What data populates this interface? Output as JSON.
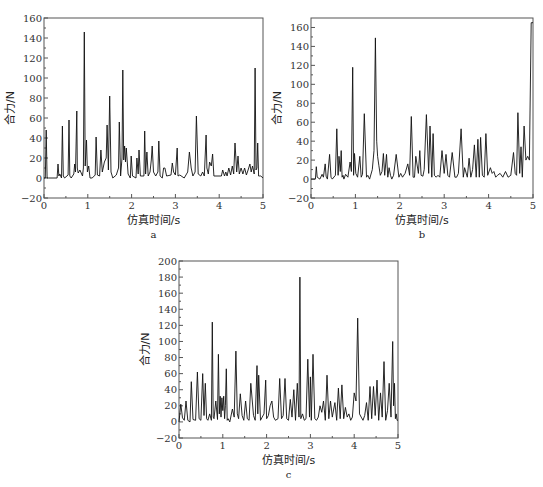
{
  "chart_data": [
    {
      "type": "line",
      "panel_label": "a",
      "title": "",
      "xlabel": "仿真时间/s",
      "ylabel": "合力/N",
      "xlim": [
        0,
        5
      ],
      "ylim": [
        -20,
        160
      ],
      "xticks": [
        0,
        1,
        2,
        3,
        4,
        5
      ],
      "yticks": [
        -20,
        0,
        20,
        40,
        60,
        80,
        100,
        120,
        140,
        160
      ],
      "grid": false,
      "legend": null,
      "series": [
        {
          "name": "合力",
          "x": [
            0,
            0.03,
            0.05,
            0.07,
            0.1,
            0.3,
            0.32,
            0.34,
            0.36,
            0.4,
            0.42,
            0.44,
            0.47,
            0.55,
            0.57,
            0.59,
            0.62,
            0.68,
            0.7,
            0.72,
            0.75,
            0.76,
            0.78,
            0.82,
            0.88,
            0.9,
            0.92,
            0.94,
            0.97,
            0.99,
            1.02,
            1.05,
            1.1,
            1.17,
            1.19,
            1.22,
            1.27,
            1.3,
            1.33,
            1.38,
            1.42,
            1.44,
            1.47,
            1.5,
            1.53,
            1.57,
            1.65,
            1.7,
            1.72,
            1.75,
            1.78,
            1.8,
            1.82,
            1.84,
            1.86,
            1.88,
            1.92,
            1.97,
            1.99,
            2.02,
            2.1,
            2.12,
            2.15,
            2.17,
            2.2,
            2.28,
            2.3,
            2.32,
            2.35,
            2.38,
            2.42,
            2.45,
            2.47,
            2.5,
            2.55,
            2.6,
            2.62,
            2.65,
            2.7,
            2.73,
            2.76,
            2.8,
            2.9,
            2.93,
            2.96,
            3.0,
            3.04,
            3.06,
            3.1,
            3.2,
            3.28,
            3.32,
            3.36,
            3.4,
            3.45,
            3.48,
            3.52,
            3.58,
            3.62,
            3.66,
            3.7,
            3.72,
            3.75,
            3.78,
            3.82,
            3.85,
            3.88,
            3.95,
            4.05,
            4.08,
            4.12,
            4.15,
            4.18,
            4.22,
            4.26,
            4.3,
            4.33,
            4.36,
            4.4,
            4.43,
            4.46,
            4.5,
            4.54,
            4.58,
            4.62,
            4.66,
            4.7,
            4.73,
            4.76,
            4.8,
            4.82,
            4.84,
            4.86,
            4.88,
            4.9,
            4.92,
            4.95,
            5.0
          ],
          "values": [
            0,
            0,
            48,
            0,
            0,
            0,
            14,
            2,
            4,
            0,
            52,
            2,
            0,
            3,
            58,
            2,
            0,
            4,
            14,
            6,
            67,
            10,
            5,
            8,
            2,
            10,
            146,
            12,
            38,
            6,
            12,
            0,
            0,
            3,
            41,
            3,
            2,
            28,
            6,
            16,
            20,
            53,
            8,
            82,
            6,
            0,
            3,
            10,
            56,
            2,
            20,
            108,
            18,
            32,
            16,
            30,
            4,
            0,
            22,
            2,
            0,
            20,
            4,
            28,
            2,
            2,
            47,
            4,
            26,
            2,
            6,
            18,
            32,
            6,
            2,
            6,
            37,
            2,
            0,
            10,
            10,
            2,
            3,
            15,
            6,
            3,
            30,
            2,
            3,
            0,
            6,
            26,
            10,
            2,
            6,
            62,
            4,
            2,
            6,
            2,
            43,
            10,
            4,
            16,
            12,
            24,
            2,
            2,
            2,
            8,
            2,
            6,
            2,
            10,
            3,
            12,
            4,
            35,
            6,
            22,
            4,
            10,
            4,
            10,
            3,
            8,
            14,
            6,
            12,
            4,
            110,
            8,
            10,
            35,
            2,
            2,
            2,
            0
          ]
        }
      ]
    },
    {
      "type": "line",
      "panel_label": "b",
      "title": "",
      "xlabel": "仿真时间/s",
      "ylabel": "合力/N",
      "xlim": [
        0,
        5
      ],
      "ylim": [
        -20,
        170
      ],
      "xticks": [
        0,
        1,
        2,
        3,
        4,
        5
      ],
      "yticks": [
        -20,
        0,
        20,
        40,
        60,
        80,
        100,
        120,
        140,
        160
      ],
      "grid": false,
      "legend": null,
      "series": [
        {
          "name": "合力",
          "x": [
            0,
            0.1,
            0.12,
            0.14,
            0.2,
            0.25,
            0.28,
            0.32,
            0.34,
            0.37,
            0.42,
            0.45,
            0.48,
            0.55,
            0.58,
            0.61,
            0.63,
            0.66,
            0.68,
            0.7,
            0.72,
            0.74,
            0.78,
            0.83,
            0.88,
            0.91,
            0.94,
            0.96,
            0.98,
            1.01,
            1.05,
            1.1,
            1.13,
            1.16,
            1.2,
            1.25,
            1.28,
            1.32,
            1.38,
            1.42,
            1.45,
            1.48,
            1.5,
            1.53,
            1.56,
            1.6,
            1.63,
            1.66,
            1.7,
            1.73,
            1.76,
            1.79,
            1.82,
            1.86,
            1.92,
            1.98,
            2.02,
            2.06,
            2.12,
            2.18,
            2.22,
            2.26,
            2.3,
            2.33,
            2.36,
            2.42,
            2.45,
            2.48,
            2.52,
            2.55,
            2.6,
            2.65,
            2.68,
            2.72,
            2.75,
            2.78,
            2.82,
            2.86,
            2.9,
            2.95,
            3.0,
            3.04,
            3.08,
            3.12,
            3.18,
            3.24,
            3.28,
            3.32,
            3.38,
            3.43,
            3.46,
            3.52,
            3.56,
            3.6,
            3.64,
            3.68,
            3.72,
            3.76,
            3.79,
            3.82,
            3.86,
            3.9,
            3.94,
            3.98,
            4.04,
            4.08,
            4.12,
            4.16,
            4.2,
            4.26,
            4.32,
            4.38,
            4.44,
            4.5,
            4.56,
            4.6,
            4.63,
            4.66,
            4.7,
            4.73,
            4.76,
            4.8,
            4.84,
            4.88,
            4.92,
            4.96,
            5.0
          ],
          "values": [
            0,
            0,
            13,
            2,
            0,
            5,
            2,
            16,
            3,
            0,
            26,
            2,
            0,
            4,
            53,
            4,
            24,
            8,
            30,
            2,
            4,
            0,
            5,
            2,
            18,
            8,
            118,
            4,
            27,
            6,
            2,
            24,
            2,
            5,
            69,
            2,
            4,
            0,
            10,
            30,
            149,
            40,
            24,
            14,
            4,
            8,
            27,
            4,
            26,
            2,
            12,
            4,
            0,
            4,
            26,
            2,
            6,
            2,
            6,
            16,
            4,
            66,
            2,
            2,
            24,
            6,
            30,
            4,
            3,
            10,
            68,
            6,
            56,
            2,
            48,
            4,
            2,
            4,
            2,
            30,
            6,
            26,
            4,
            2,
            28,
            2,
            2,
            6,
            53,
            2,
            12,
            2,
            22,
            2,
            10,
            36,
            2,
            42,
            2,
            44,
            4,
            2,
            48,
            4,
            12,
            6,
            8,
            2,
            4,
            6,
            2,
            8,
            2,
            4,
            28,
            6,
            4,
            70,
            6,
            34,
            2,
            56,
            20,
            24,
            20,
            165,
            165
          ]
        }
      ]
    },
    {
      "type": "line",
      "panel_label": "c",
      "title": "",
      "xlabel": "仿真时间/s",
      "ylabel": "合力/N",
      "xlim": [
        0,
        5
      ],
      "ylim": [
        -20,
        200
      ],
      "xticks": [
        0,
        1,
        2,
        3,
        4,
        5
      ],
      "yticks": [
        -20,
        0,
        20,
        40,
        60,
        80,
        100,
        120,
        140,
        160,
        180,
        200
      ],
      "grid": false,
      "legend": null,
      "series": [
        {
          "name": "合力",
          "x": [
            0,
            0.04,
            0.08,
            0.12,
            0.16,
            0.2,
            0.25,
            0.28,
            0.32,
            0.38,
            0.42,
            0.46,
            0.5,
            0.54,
            0.57,
            0.6,
            0.63,
            0.66,
            0.7,
            0.74,
            0.76,
            0.78,
            0.8,
            0.84,
            0.88,
            0.9,
            0.92,
            0.94,
            0.96,
            0.98,
            1.0,
            1.02,
            1.04,
            1.06,
            1.08,
            1.1,
            1.12,
            1.16,
            1.22,
            1.26,
            1.3,
            1.33,
            1.36,
            1.4,
            1.44,
            1.48,
            1.52,
            1.56,
            1.6,
            1.64,
            1.7,
            1.74,
            1.78,
            1.8,
            1.82,
            1.86,
            1.9,
            1.94,
            1.98,
            2.0,
            2.04,
            2.08,
            2.12,
            2.16,
            2.2,
            2.26,
            2.3,
            2.34,
            2.38,
            2.42,
            2.46,
            2.5,
            2.54,
            2.58,
            2.62,
            2.66,
            2.7,
            2.74,
            2.76,
            2.78,
            2.82,
            2.86,
            2.9,
            2.94,
            2.98,
            3.0,
            3.02,
            3.06,
            3.1,
            3.14,
            3.18,
            3.22,
            3.26,
            3.3,
            3.34,
            3.38,
            3.42,
            3.46,
            3.5,
            3.56,
            3.6,
            3.64,
            3.68,
            3.72,
            3.76,
            3.8,
            3.84,
            3.88,
            3.92,
            3.96,
            4.0,
            4.04,
            4.08,
            4.12,
            4.16,
            4.2,
            4.24,
            4.28,
            4.32,
            4.36,
            4.4,
            4.44,
            4.48,
            4.52,
            4.56,
            4.6,
            4.64,
            4.68,
            4.72,
            4.76,
            4.8,
            4.84,
            4.88,
            4.9,
            4.92,
            4.94,
            4.96,
            4.98,
            5.0
          ],
          "values": [
            0,
            22,
            5,
            2,
            26,
            2,
            0,
            50,
            3,
            2,
            62,
            4,
            2,
            60,
            8,
            48,
            4,
            2,
            10,
            2,
            124,
            6,
            4,
            26,
            3,
            84,
            10,
            32,
            6,
            30,
            14,
            32,
            4,
            20,
            66,
            2,
            4,
            0,
            16,
            6,
            88,
            10,
            4,
            35,
            8,
            2,
            26,
            4,
            2,
            48,
            8,
            2,
            70,
            10,
            58,
            2,
            6,
            10,
            52,
            4,
            8,
            20,
            26,
            6,
            2,
            4,
            54,
            4,
            8,
            54,
            4,
            2,
            28,
            6,
            40,
            2,
            48,
            6,
            180,
            4,
            10,
            2,
            4,
            78,
            6,
            56,
            2,
            84,
            4,
            2,
            6,
            20,
            12,
            26,
            2,
            58,
            4,
            26,
            6,
            24,
            2,
            42,
            4,
            46,
            4,
            18,
            6,
            10,
            2,
            6,
            36,
            26,
            129,
            10,
            6,
            2,
            8,
            24,
            2,
            44,
            4,
            44,
            8,
            52,
            2,
            36,
            6,
            75,
            2,
            14,
            48,
            6,
            100,
            20,
            48,
            4,
            10,
            2,
            2
          ]
        }
      ]
    }
  ],
  "panels": [
    {
      "label": "a",
      "xlabel": "仿真时间/s",
      "ylabel": "合力/N"
    },
    {
      "label": "b",
      "xlabel": "仿真时间/s",
      "ylabel": "合力/N"
    },
    {
      "label": "c",
      "xlabel": "仿真时间/s",
      "ylabel": "合力/N"
    }
  ],
  "colors": {
    "line": "#111111",
    "axis": "#555555",
    "background": "#ffffff"
  }
}
